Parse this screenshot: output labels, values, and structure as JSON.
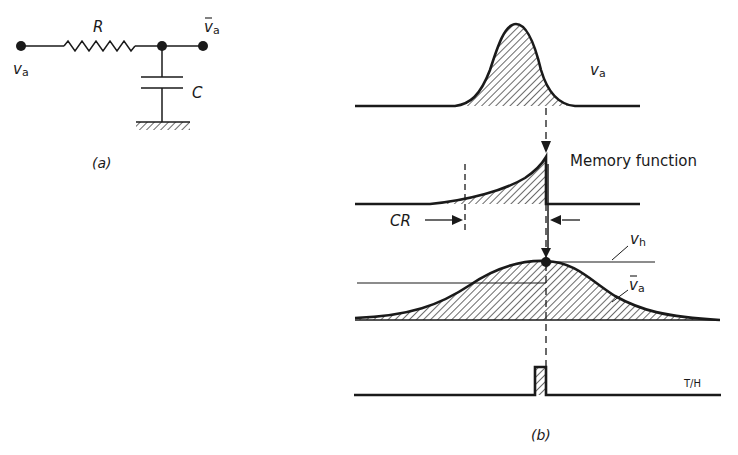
{
  "figure_a": {
    "caption": "(a)",
    "input_label": "v",
    "input_sub": "a",
    "output_label": "v",
    "output_sub": "a",
    "output_bar": true,
    "resistor_label": "R",
    "capacitor_label": "C"
  },
  "figure_b": {
    "caption": "(b)",
    "trace1_label": "v",
    "trace1_sub": "a",
    "trace2_label": "Memory function",
    "cr_label": "CR",
    "vh_label": "v",
    "vh_sub": "h",
    "vbar_label": "v",
    "vbar_sub": "a",
    "th_label": "T/H"
  },
  "colors": {
    "ink": "#1a1a1a",
    "background": "#ffffff"
  }
}
